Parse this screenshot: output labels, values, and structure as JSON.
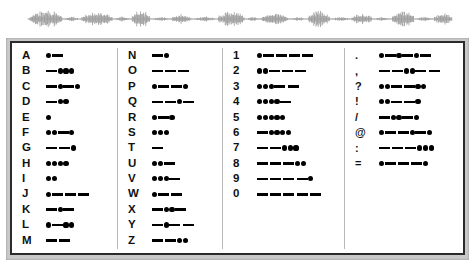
{
  "waveform": {
    "label": "audio-waveform",
    "color": "#8a8a8a",
    "baseline_color": "#9a9a9a"
  },
  "colors": {
    "frame": "#c9c9c9",
    "border": "#2b2b2b",
    "panel": "#ffffff",
    "mark": "#000000",
    "divider": "#b8b8b8",
    "text": "#111111"
  },
  "table": {
    "columns": [
      {
        "name": "letters-a-m",
        "rows": [
          {
            "key": "A",
            "code": ".-"
          },
          {
            "key": "B",
            "code": "-..."
          },
          {
            "key": "C",
            "code": "-.-."
          },
          {
            "key": "D",
            "code": "-.."
          },
          {
            "key": "E",
            "code": "."
          },
          {
            "key": "F",
            "code": "..-."
          },
          {
            "key": "G",
            "code": "--."
          },
          {
            "key": "H",
            "code": "...."
          },
          {
            "key": "I",
            "code": ".."
          },
          {
            "key": "J",
            "code": ".---"
          },
          {
            "key": "K",
            "code": "-.-"
          },
          {
            "key": "L",
            "code": ".-.."
          },
          {
            "key": "M",
            "code": "--"
          }
        ]
      },
      {
        "name": "letters-n-z",
        "rows": [
          {
            "key": "N",
            "code": "-."
          },
          {
            "key": "O",
            "code": "---"
          },
          {
            "key": "P",
            "code": ".--."
          },
          {
            "key": "Q",
            "code": "--.-"
          },
          {
            "key": "R",
            "code": ".-."
          },
          {
            "key": "S",
            "code": "..."
          },
          {
            "key": "T",
            "code": "-"
          },
          {
            "key": "U",
            "code": "..-"
          },
          {
            "key": "V",
            "code": "...-"
          },
          {
            "key": "W",
            "code": ".--"
          },
          {
            "key": "X",
            "code": "-..-"
          },
          {
            "key": "Y",
            "code": "-.--"
          },
          {
            "key": "Z",
            "code": "--.."
          }
        ]
      },
      {
        "name": "numbers",
        "rows": [
          {
            "key": "1",
            "code": ".----"
          },
          {
            "key": "2",
            "code": "..---"
          },
          {
            "key": "3",
            "code": "...--"
          },
          {
            "key": "4",
            "code": "....-"
          },
          {
            "key": "5",
            "code": "....."
          },
          {
            "key": "6",
            "code": "-...."
          },
          {
            "key": "7",
            "code": "--..."
          },
          {
            "key": "8",
            "code": "---.."
          },
          {
            "key": "9",
            "code": "----."
          },
          {
            "key": "0",
            "code": "-----"
          }
        ]
      },
      {
        "name": "punctuation",
        "rows": [
          {
            "key": ".",
            "code": ".-.-.-"
          },
          {
            "key": ",",
            "code": "--..--"
          },
          {
            "key": "?",
            "code": "..--.."
          },
          {
            "key": "!",
            "code": "..--."
          },
          {
            "key": "/",
            "code": "-..-."
          },
          {
            "key": "@",
            "code": ".--.-."
          },
          {
            "key": ":",
            "code": "---..."
          },
          {
            "key": "=",
            "code": ".---."
          }
        ]
      }
    ]
  }
}
